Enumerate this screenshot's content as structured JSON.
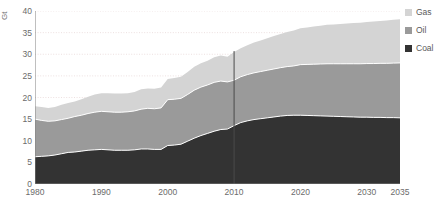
{
  "chart_data": {
    "type": "area",
    "stacked": true,
    "title": "",
    "xlabel": "",
    "ylabel": "Gt",
    "xlim": [
      1980,
      2035
    ],
    "ylim": [
      0,
      40
    ],
    "yticks": [
      0,
      5,
      10,
      15,
      20,
      25,
      30,
      35,
      40
    ],
    "xticks": [
      1980,
      1990,
      2000,
      2010,
      2020,
      2030,
      2035
    ],
    "grid": true,
    "grid_axis": "y",
    "legend_position": "right",
    "divider_x": 2010,
    "divider_label": "",
    "x": [
      1980,
      1981,
      1982,
      1983,
      1984,
      1985,
      1986,
      1987,
      1988,
      1989,
      1990,
      1991,
      1992,
      1993,
      1994,
      1995,
      1996,
      1997,
      1998,
      1999,
      2000,
      2001,
      2002,
      2003,
      2004,
      2005,
      2006,
      2007,
      2008,
      2009,
      2010,
      2011,
      2012,
      2013,
      2014,
      2015,
      2016,
      2017,
      2018,
      2019,
      2020,
      2021,
      2022,
      2023,
      2024,
      2025,
      2026,
      2027,
      2028,
      2029,
      2030,
      2031,
      2032,
      2033,
      2034,
      2035
    ],
    "series": [
      {
        "name": "Coal",
        "color": "#333333",
        "values": [
          6.3,
          6.4,
          6.5,
          6.7,
          7.0,
          7.3,
          7.4,
          7.6,
          7.8,
          7.9,
          8.0,
          7.9,
          7.8,
          7.8,
          7.8,
          7.9,
          8.1,
          8.1,
          8.0,
          8.0,
          8.9,
          9.0,
          9.2,
          9.9,
          10.6,
          11.2,
          11.7,
          12.2,
          12.6,
          12.7,
          13.5,
          14.2,
          14.6,
          14.9,
          15.1,
          15.3,
          15.5,
          15.7,
          15.85,
          15.9,
          15.9,
          15.85,
          15.8,
          15.75,
          15.7,
          15.65,
          15.6,
          15.55,
          15.5,
          15.45,
          15.45,
          15.4,
          15.4,
          15.35,
          15.35,
          15.3
        ]
      },
      {
        "name": "Oil",
        "color": "#9a9a9a",
        "values": [
          8.7,
          8.3,
          8.0,
          7.9,
          7.9,
          7.9,
          8.2,
          8.3,
          8.5,
          8.7,
          8.8,
          8.8,
          8.8,
          8.8,
          8.9,
          9.0,
          9.2,
          9.4,
          9.4,
          9.6,
          10.6,
          10.6,
          10.6,
          10.8,
          11.1,
          11.2,
          11.2,
          11.3,
          11.2,
          10.9,
          10.5,
          10.6,
          10.7,
          10.8,
          10.9,
          11.0,
          11.1,
          11.2,
          11.3,
          11.4,
          11.7,
          11.8,
          11.9,
          12.0,
          12.1,
          12.15,
          12.2,
          12.25,
          12.3,
          12.35,
          12.4,
          12.45,
          12.5,
          12.55,
          12.6,
          12.7
        ]
      },
      {
        "name": "Gas",
        "color": "#d4d4d4",
        "values": [
          3.0,
          3.1,
          3.1,
          3.2,
          3.4,
          3.5,
          3.5,
          3.7,
          3.9,
          4.1,
          4.2,
          4.3,
          4.3,
          4.3,
          4.3,
          4.4,
          4.6,
          4.6,
          4.6,
          4.7,
          4.8,
          4.9,
          5.0,
          5.2,
          5.4,
          5.5,
          5.6,
          5.8,
          5.9,
          5.8,
          6.5,
          6.6,
          6.8,
          7.0,
          7.2,
          7.4,
          7.6,
          7.8,
          8.0,
          8.2,
          8.4,
          8.55,
          8.7,
          8.85,
          9.0,
          9.1,
          9.2,
          9.3,
          9.4,
          9.5,
          9.6,
          9.7,
          9.8,
          9.9,
          10.0,
          10.1
        ]
      }
    ]
  },
  "axes": {
    "y_title": "Gt",
    "y_tick_labels": [
      "0",
      "5",
      "10",
      "15",
      "20",
      "25",
      "30",
      "35",
      "40"
    ],
    "x_tick_labels": [
      "1980",
      "1990",
      "2000",
      "2010",
      "2020",
      "2030",
      "2035"
    ]
  },
  "legend": {
    "items": [
      {
        "label": "Gas",
        "color": "#d4d4d4"
      },
      {
        "label": "Oil",
        "color": "#9a9a9a"
      },
      {
        "label": "Coal",
        "color": "#333333"
      }
    ]
  },
  "style": {
    "grid_color": "#e8d8d8",
    "axis_color": "#808080",
    "divider_color": "#4a4a4a",
    "band_separator_color": "#ffffff",
    "text_color": "#6b6b6b",
    "background": "#ffffff"
  }
}
